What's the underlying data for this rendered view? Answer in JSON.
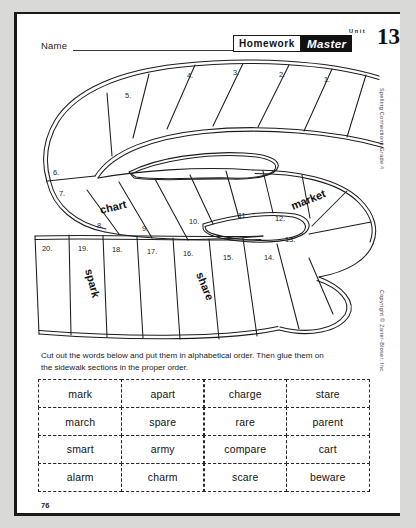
{
  "page": {
    "number": "76",
    "side_series_text": "Spelling Connections Grade 4",
    "side_copyright_text": "Copyright © Zaner-Bloser, Inc."
  },
  "header": {
    "name_label": "Name",
    "homework_label": "Homework",
    "master_label": "Master",
    "unit_label": "Unit",
    "unit_number": "13"
  },
  "instructions": {
    "text": "Cut out the words below and put them in alphabetical order. Then glue them on the sidewalk sections in the proper order."
  },
  "maze": {
    "numbers": [
      "1.",
      "2.",
      "3.",
      "4.",
      "5.",
      "6.",
      "7.",
      "8.",
      "9.",
      "10.",
      "11.",
      "12.",
      "13.",
      "14.",
      "15.",
      "16.",
      "17.",
      "18.",
      "19.",
      "20."
    ],
    "filled_words": [
      {
        "section": "7",
        "word": "chart"
      },
      {
        "section": "12",
        "word": "market"
      },
      {
        "section": "19",
        "word": "spark"
      },
      {
        "section": "16",
        "word": "share"
      }
    ]
  },
  "word_bank": {
    "rows": [
      [
        "mark",
        "apart",
        "charge",
        "stare"
      ],
      [
        "march",
        "spare",
        "rare",
        "parent"
      ],
      [
        "smart",
        "army",
        "compare",
        "cart"
      ],
      [
        "alarm",
        "charm",
        "scare",
        "beware"
      ]
    ]
  },
  "colors": {
    "ink": "#1a1a1a",
    "paper": "#ffffff",
    "backdrop": "#d9d9d7"
  }
}
